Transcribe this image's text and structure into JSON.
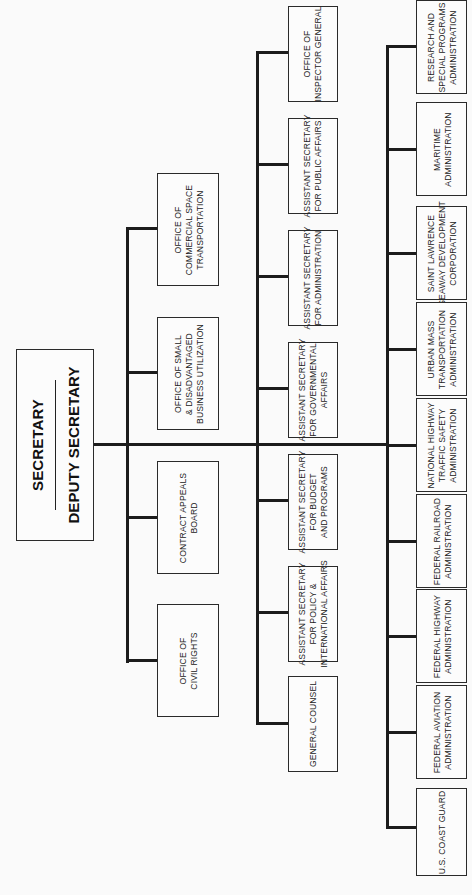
{
  "chart_title": "Department Organization Chart",
  "orientation": "rotated-90-counterclockwise",
  "root": {
    "title": "SECRETARY",
    "subtitle": "DEPUTY SECRETARY"
  },
  "staff_offices": [
    {
      "lines": [
        "OFFICE OF",
        "COMMERCIAL SPACE",
        "TRANSPORTATION"
      ]
    },
    {
      "lines": [
        "OFFICE OF SMALL",
        "& DISADVANTAGED",
        "BUSINESS UTILIZATION"
      ]
    },
    {
      "lines": [
        "CONTRACT APPEALS",
        "BOARD"
      ]
    },
    {
      "lines": [
        "OFFICE OF",
        "CIVIL RIGHTS"
      ]
    }
  ],
  "secretarial_offices": [
    {
      "lines": [
        "OFFICE OF",
        "INSPECTOR GENERAL"
      ]
    },
    {
      "lines": [
        "ASSISTANT SECRETARY",
        "FOR PUBLIC AFFAIRS"
      ]
    },
    {
      "lines": [
        "ASSISTANT SECRETARY",
        "FOR ADMINISTRATION"
      ]
    },
    {
      "lines": [
        "ASSISTANT SECRETARY",
        "FOR GOVERNMENTAL",
        "AFFAIRS"
      ]
    },
    {
      "lines": [
        "ASSISTANT SECRETARY",
        "FOR BUDGET",
        "AND PROGRAMS"
      ]
    },
    {
      "lines": [
        "ASSISTANT SECRETARY",
        "FOR POLICY &",
        "INTERNATIONAL AFFAIRS"
      ]
    },
    {
      "lines": [
        "GENERAL COUNSEL"
      ]
    }
  ],
  "operating_administrations": [
    {
      "lines": [
        "RESEARCH AND",
        "SPECIAL PROGRAMS",
        "ADMINISTRATION"
      ]
    },
    {
      "lines": [
        "MARITIME",
        "ADMINISTRATION"
      ]
    },
    {
      "lines": [
        "SAINT LAWRENCE",
        "SEAWAY DEVELOPMENT",
        "CORPORATION"
      ]
    },
    {
      "lines": [
        "URBAN MASS",
        "TRANSPORTATION",
        "ADMINISTRATION"
      ]
    },
    {
      "lines": [
        "NATIONAL HIGHWAY",
        "TRAFFIC SAFETY",
        "ADMINISTRATION"
      ]
    },
    {
      "lines": [
        "FEDERAL RAILROAD",
        "ADMINISTRATION"
      ]
    },
    {
      "lines": [
        "FEDERAL HIGHWAY",
        "ADMINISTRATION"
      ]
    },
    {
      "lines": [
        "FEDERAL AVIATION",
        "ADMINISTRATION"
      ]
    },
    {
      "lines": [
        "U.S. COAST GUARD"
      ]
    }
  ]
}
